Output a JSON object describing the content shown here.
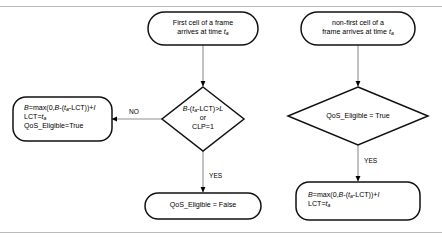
{
  "diagram": {
    "colors": {
      "shape_stroke": "#111111",
      "shape_fill": "#ffffff",
      "connector": "#8f8f8f",
      "arrowhead": "#000000",
      "rule": "#b9b9b9",
      "text": "#000000"
    },
    "rules": {
      "top_y": 6,
      "bottom_y": 232
    },
    "nodes": {
      "start_first_cell": {
        "shape": "terminal",
        "line1": "First cell of a frame",
        "line2_pre": "arrives at time ",
        "line2_var": "t",
        "line2_sub": "a"
      },
      "start_non_first_cell": {
        "shape": "terminal",
        "line1": "non-first cell of a",
        "line2_pre": "frame arrives at time ",
        "line2_var": "t",
        "line2_sub": "a"
      },
      "decision_bucket": {
        "shape": "diamond",
        "line1_a": "B",
        "line1_b": "-(",
        "line1_var": "t",
        "line1_sub": "a",
        "line1_c": "-LCT)>",
        "line1_d": "L",
        "line2": "or",
        "line3": "CLP=1"
      },
      "decision_qos_eligible": {
        "shape": "diamond",
        "line1": "QoS_Eligible = True"
      },
      "process_update_conforming": {
        "shape": "process",
        "line1_a": "B",
        "line1_b": "=max(0,",
        "line1_c": "B",
        "line1_d": "-(",
        "line1_var": "t",
        "line1_sub": "a",
        "line1_e": "-LCT))+",
        "line1_f": "I",
        "line2_pre": "LCT=",
        "line2_var": "t",
        "line2_sub": "a",
        "line3": "QoS_Eligible=True"
      },
      "end_qos_false": {
        "shape": "terminal",
        "line1": "QoS_Eligible = False"
      },
      "process_update_non_first": {
        "shape": "process",
        "line1_a": "B",
        "line1_b": "=max(0,",
        "line1_c": "B",
        "line1_d": "-(",
        "line1_var": "t",
        "line1_sub": "a",
        "line1_e": "-LCT))+",
        "line1_f": "I",
        "line2_pre": "LCT=",
        "line2_var": "t",
        "line2_sub": "a"
      }
    },
    "edge_labels": {
      "no_branch": "NO",
      "yes_branch_left": "YES",
      "yes_branch_right": "YES"
    }
  }
}
